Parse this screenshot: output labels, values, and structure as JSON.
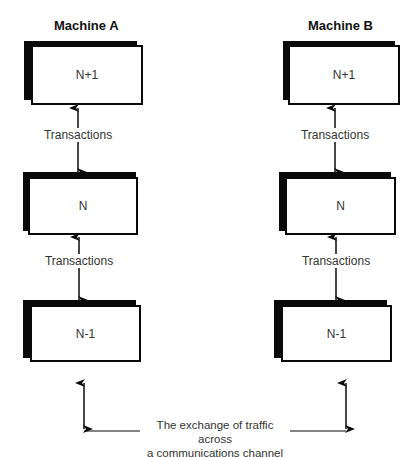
{
  "diagram": {
    "machines": [
      {
        "title": "Machine A",
        "layers": [
          "N+1",
          "N",
          "N-1"
        ],
        "transaction_labels": [
          "Transactions",
          "Transactions"
        ]
      },
      {
        "title": "Machine B",
        "layers": [
          "N+1",
          "N",
          "N-1"
        ],
        "transaction_labels": [
          "Transactions",
          "Transactions"
        ]
      }
    ],
    "channel": {
      "line1": "The exchange of traffic across",
      "line2": "a communications channel"
    },
    "colors": {
      "stroke": "#0a0a0a",
      "text": "#333333",
      "background": "#ffffff"
    }
  }
}
